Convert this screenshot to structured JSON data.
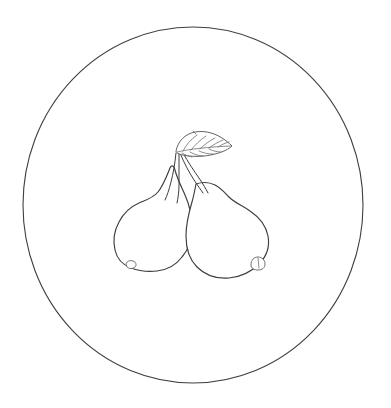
{
  "image": {
    "title": "Two Pears With Leaf Line Drawing",
    "style": "black-and-white outline coloring-page illustration",
    "background_color": "#ffffff",
    "line_color": "#3d3d3d",
    "secondary_line_color": "#6d6d6d",
    "width": 391,
    "height": 408
  },
  "scene": {
    "frame": {
      "name": "circle-border",
      "shape": "circle",
      "center_x": 193,
      "center_y": 205,
      "radius_x": 170,
      "radius_y": 178,
      "stroke": "#3f3f3f",
      "fill": "none"
    },
    "subjects": [
      {
        "name": "left-pear",
        "label": "Left Pear",
        "orientation": "upright, leaning slightly right",
        "bulb_center_x": 150,
        "bulb_center_y": 235,
        "blossom_nub_x": 131,
        "blossom_nub_y": 266
      },
      {
        "name": "right-pear",
        "label": "Right Pear",
        "orientation": "tilted, leaning right",
        "bulb_center_x": 228,
        "bulb_center_y": 233,
        "blossom_nub_x": 258,
        "blossom_nub_y": 263
      },
      {
        "name": "leaf",
        "label": "Leaf",
        "orientation": "pointing right and slightly up",
        "tip_x": 231,
        "tip_y": 145,
        "base_x": 176,
        "base_y": 152,
        "vein_count": 7
      },
      {
        "name": "stems",
        "label": "Stems",
        "convergence_x": 178,
        "convergence_y": 152,
        "stem_count": 4
      }
    ]
  },
  "caption": {
    "alt_text": "Outline drawing of two pears joined at the stem with a single leaf, enclosed in a circle."
  }
}
